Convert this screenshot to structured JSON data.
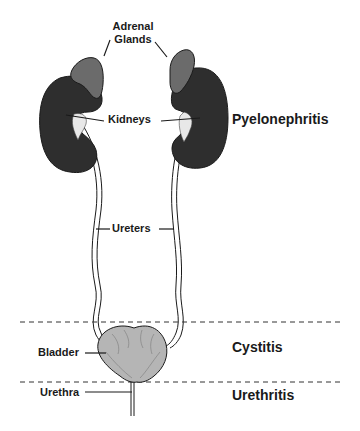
{
  "diagram": {
    "structure_labels": {
      "adrenal_line1": "Adrenal",
      "adrenal_line2": "Glands",
      "kidneys": "Kidneys",
      "ureters": "Ureters",
      "bladder": "Bladder",
      "urethra": "Urethra"
    },
    "condition_labels": {
      "kidney_infection": "Pyelonephritis",
      "bladder_infection": "Cystitis",
      "urethra_infection": "Urethritis"
    },
    "colors": {
      "kidney": "#2e2e2e",
      "adrenal": "#6b6b6b",
      "bladder": "#b5b5b5",
      "outline": "#1a1a1a",
      "dashed_line": "#333333"
    }
  }
}
